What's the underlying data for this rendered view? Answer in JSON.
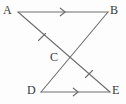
{
  "figure": {
    "type": "geometry-diagram",
    "canvas": {
      "width": 126,
      "height": 104
    },
    "background_color": "#fdfdfd",
    "stroke_color": "#6e6e70",
    "label_color": "#39393b",
    "points": [
      {
        "name": "A",
        "label": "A",
        "x": 18,
        "y": 12,
        "label_x": 3,
        "label_y": 4
      },
      {
        "name": "B",
        "label": "B",
        "x": 108,
        "y": 12,
        "label_x": 110,
        "label_y": 4
      },
      {
        "name": "C",
        "label": "C",
        "x": 69,
        "y": 59,
        "label_x": 50,
        "label_y": 51
      },
      {
        "name": "D",
        "label": "D",
        "x": 41,
        "y": 92,
        "label_x": 27,
        "label_y": 84
      },
      {
        "name": "E",
        "label": "E",
        "x": 110,
        "y": 92,
        "label_x": 112,
        "label_y": 84
      }
    ],
    "segments": [
      {
        "name": "segment-AB",
        "from": "A",
        "to": "B",
        "x1": 18,
        "y1": 12,
        "x2": 108,
        "y2": 12
      },
      {
        "name": "segment-DE",
        "from": "D",
        "to": "E",
        "x1": 41,
        "y1": 92,
        "x2": 110,
        "y2": 92
      },
      {
        "name": "segment-AE",
        "from": "A",
        "to": "E",
        "x1": 18,
        "y1": 12,
        "x2": 110,
        "y2": 92
      },
      {
        "name": "segment-BD",
        "from": "B",
        "to": "D",
        "x1": 108,
        "y1": 12,
        "x2": 41,
        "y2": 92
      }
    ],
    "arrow_marks": [
      {
        "name": "arrow-mark-AB",
        "on_segment": "segment-AB",
        "x": 64,
        "y": 12,
        "direction": "right",
        "count": 1
      },
      {
        "name": "arrow-mark-DE",
        "on_segment": "segment-DE",
        "x": 77,
        "y": 92,
        "direction": "right",
        "count": 1
      }
    ],
    "tick_marks": [
      {
        "name": "tick-mark-AC",
        "on_segment": "segment-AE",
        "x": 42,
        "y": 37,
        "count": 1
      },
      {
        "name": "tick-mark-CE",
        "on_segment": "segment-AE",
        "x": 89,
        "y": 74,
        "count": 1
      }
    ]
  }
}
